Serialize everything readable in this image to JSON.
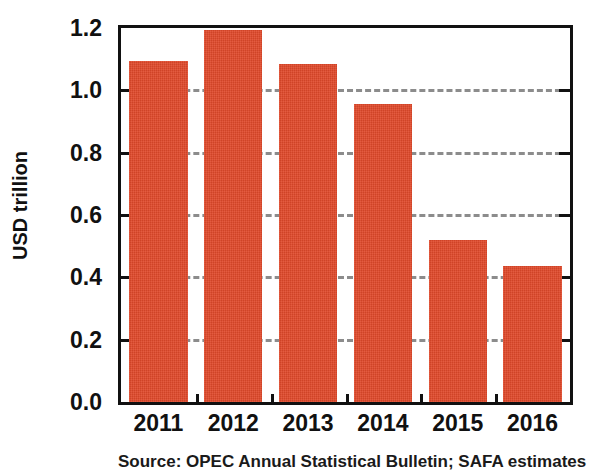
{
  "chart_data": {
    "type": "bar",
    "title": "",
    "subtitle": "",
    "xlabel": "",
    "ylabel": "USD trillion",
    "categories": [
      "2011",
      "2012",
      "2013",
      "2014",
      "2015",
      "2016"
    ],
    "values": [
      1.095,
      1.195,
      1.085,
      0.955,
      0.52,
      0.435
    ],
    "series": [
      {
        "name": "USD trillion",
        "values": [
          1.095,
          1.195,
          1.085,
          0.955,
          0.52,
          0.435
        ]
      }
    ],
    "ylim": [
      0.0,
      1.2
    ],
    "ytick_labels": [
      "0.0",
      "0.2",
      "0.4",
      "0.6",
      "0.8",
      "1.0",
      "1.2"
    ],
    "ytick_values": [
      0.0,
      0.2,
      0.4,
      0.6,
      0.8,
      1.0,
      1.2
    ],
    "grid": "horizontal-dashed",
    "legend": "none",
    "bar_color": "#e0492a",
    "grid_color": "#8c8c8c",
    "axis_color": "#111111"
  },
  "caption": {
    "source_text": "Source: OPEC Annual Statistical Bulletin; SAFA estimates"
  }
}
